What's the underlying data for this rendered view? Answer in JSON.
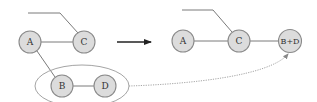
{
  "diagram": {
    "left_graph": {
      "nodes": [
        {
          "id": "A",
          "label": "A",
          "cx": 30,
          "cy": 42
        },
        {
          "id": "C",
          "label": "C",
          "cx": 84,
          "cy": 42
        },
        {
          "id": "B",
          "label": "B",
          "cx": 62,
          "cy": 86
        },
        {
          "id": "D",
          "label": "D",
          "cx": 105,
          "cy": 86
        }
      ],
      "edges": [
        {
          "from": "A",
          "to": "C"
        },
        {
          "from": "A",
          "to": "B"
        },
        {
          "from": "B",
          "to": "D"
        },
        {
          "from": "external",
          "to": "C"
        }
      ],
      "group": {
        "members": [
          "B",
          "D"
        ],
        "shape": "ellipse"
      }
    },
    "transform_arrow": {
      "direction": "right"
    },
    "right_graph": {
      "nodes": [
        {
          "id": "A",
          "label": "A",
          "cx": 183,
          "cy": 41
        },
        {
          "id": "C",
          "label": "C",
          "cx": 239,
          "cy": 41
        },
        {
          "id": "B+D",
          "label": "B+D",
          "cx": 290,
          "cy": 41
        }
      ],
      "edges": [
        {
          "from": "A",
          "to": "C"
        },
        {
          "from": "C",
          "to": "B+D"
        },
        {
          "from": "external",
          "to": "C"
        }
      ]
    },
    "merge_link": {
      "from": "group(B,D)",
      "to": "B+D",
      "style": "dotted"
    },
    "colors": {
      "node_fill": "#dcdcdc",
      "node_stroke": "#8a8a8a",
      "edge": "#7a7a7a",
      "arrow": "#222222"
    }
  }
}
